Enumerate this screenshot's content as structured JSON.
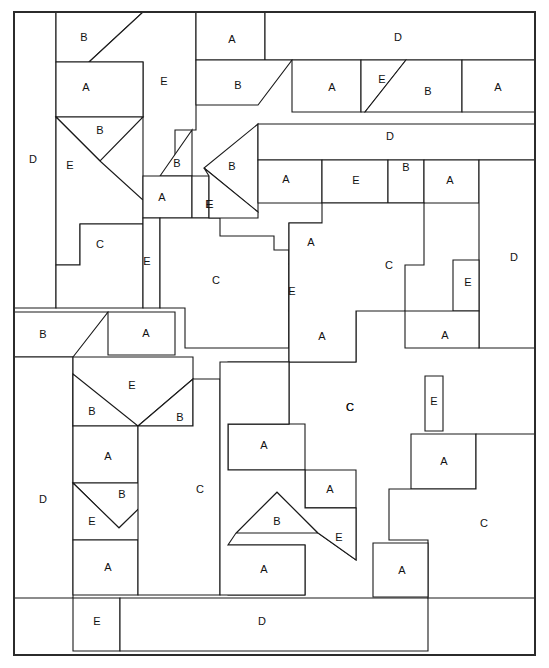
{
  "diagram": {
    "canvas": {
      "width": 549,
      "height": 668
    },
    "sheet": {
      "x": 14,
      "y": 12,
      "width": 521,
      "height": 643
    },
    "stroke_color": "#1a1a1a",
    "frame_color": "#2b2b2b",
    "fill_color": "#ffffff",
    "piece_types": [
      "A",
      "B",
      "C",
      "D",
      "E"
    ],
    "piece_count": 62,
    "pieces": [
      {
        "id": "p01",
        "label": "D",
        "lx": 33,
        "ly": 160,
        "points": "14,12 56,12 56,308 14,308"
      },
      {
        "id": "p02",
        "label": "B",
        "lx": 84,
        "ly": 38,
        "points": "56,12 143,12 89,62 56,62"
      },
      {
        "id": "p03",
        "label": "E",
        "lx": 164,
        "ly": 82,
        "points": "143,12 196,12 196,130 175,130 175,200 143,200 143,62 89,62"
      },
      {
        "id": "p04",
        "label": "A",
        "lx": 86,
        "ly": 88,
        "points": "56,62 143,62 143,117 56,117"
      },
      {
        "id": "p05",
        "label": "B",
        "lx": 100,
        "ly": 131,
        "points": "56,117 143,117 100,161"
      },
      {
        "id": "p06",
        "label": "E",
        "lx": 70,
        "ly": 166,
        "points": "56,117 100,161 143,200 143,224 80,224 80,265 56,265"
      },
      {
        "id": "p07",
        "label": "C",
        "lx": 100,
        "ly": 245,
        "points": "80,224 143,224 143,308 56,308 56,265 80,265"
      },
      {
        "id": "p08",
        "label": "B",
        "lx": 177,
        "ly": 164,
        "points": "160,176 192,130 192,176"
      },
      {
        "id": "p09",
        "label": "A",
        "lx": 162,
        "ly": 198,
        "points": "143,176 192,176 192,218 143,218"
      },
      {
        "id": "p10",
        "label": "E",
        "lx": 147,
        "ly": 262,
        "points": "143,218 160,218 160,308 143,308"
      },
      {
        "id": "p11",
        "label": "E",
        "lx": 210,
        "ly": 205,
        "points": "192,176 209,176 209,218 192,218"
      },
      {
        "id": "p12",
        "label": "C",
        "lx": 216,
        "ly": 281,
        "points": "160,218 220,218 220,236 274,236 274,250 289,250 289,348 185,348 185,308 160,308"
      },
      {
        "id": "p13",
        "label": "A",
        "lx": 232,
        "ly": 40,
        "points": "196,12 265,12 265,60 196,60"
      },
      {
        "id": "p14",
        "label": "D",
        "lx": 398,
        "ly": 38,
        "points": "265,12 535,12 535,60 265,60"
      },
      {
        "id": "p15",
        "label": "B",
        "lx": 238,
        "ly": 86,
        "points": "196,60 292,60 258,105 196,105"
      },
      {
        "id": "p16",
        "label": "A",
        "lx": 332,
        "ly": 88,
        "points": "292,60 361,60 361,112 292,112"
      },
      {
        "id": "p17",
        "label": "E",
        "lx": 382,
        "ly": 80,
        "points": "361,60 406,60 365,112 361,112"
      },
      {
        "id": "p18",
        "label": "B",
        "lx": 428,
        "ly": 92,
        "points": "406,60 462,60 462,112 365,112"
      },
      {
        "id": "p19",
        "label": "A",
        "lx": 498,
        "ly": 88,
        "points": "462,60 535,60 535,112 462,112"
      },
      {
        "id": "p20",
        "label": "B",
        "lx": 232,
        "ly": 167,
        "points": "258,124 258,212 204,168"
      },
      {
        "id": "p21",
        "label": "D",
        "lx": 390,
        "ly": 137,
        "points": "258,124 535,124 535,160 258,160"
      },
      {
        "id": "p22",
        "label": "E",
        "lx": 209,
        "ly": 205,
        "points": "204,168 258,212 258,218 209,218 209,176"
      },
      {
        "id": "p23",
        "label": "A",
        "lx": 286,
        "ly": 180,
        "points": "258,160 322,160 322,203 258,203"
      },
      {
        "id": "p24",
        "label": "E",
        "lx": 356,
        "ly": 181,
        "points": "322,160 388,160 388,203 322,203"
      },
      {
        "id": "p25",
        "label": "B",
        "lx": 406,
        "ly": 168,
        "points": "388,160 424,160 424,203 388,203"
      },
      {
        "id": "p26",
        "label": "A",
        "lx": 450,
        "ly": 181,
        "points": "424,160 479,160 479,203 424,203"
      },
      {
        "id": "p27",
        "label": "D",
        "lx": 514,
        "ly": 258,
        "points": "479,160 535,160 535,348 479,348"
      },
      {
        "id": "p28",
        "label": "A",
        "lx": 311,
        "ly": 243,
        "points": "289,223 334,223 334,264 289,264"
      },
      {
        "id": "p29",
        "label": "E",
        "lx": 292,
        "ly": 292,
        "points": "289,264 296,264 296,311 289,311"
      },
      {
        "id": "p30",
        "label": "A",
        "lx": 322,
        "ly": 337,
        "points": "289,311 356,311 356,362 289,362"
      },
      {
        "id": "p31",
        "label": "C",
        "lx": 389,
        "ly": 266,
        "points": "289,223 322,223 322,203 424,203 424,265 405,265 405,311 356,311 356,362 289,362"
      },
      {
        "id": "p32",
        "label": "E",
        "lx": 468,
        "ly": 283,
        "points": "453,260 479,260 479,311 453,311"
      },
      {
        "id": "p33",
        "label": "A",
        "lx": 445,
        "ly": 336,
        "points": "405,311 479,311 479,348 405,348"
      },
      {
        "id": "p34",
        "label": "B",
        "lx": 43,
        "ly": 335,
        "points": "14,312 108,312 73,357 14,357"
      },
      {
        "id": "p35",
        "label": "A",
        "lx": 146,
        "ly": 334,
        "points": "108,312 175,312 175,355 108,355"
      },
      {
        "id": "p36",
        "label": "D",
        "lx": 43,
        "ly": 500,
        "points": "14,357 73,357 73,598 14,598"
      },
      {
        "id": "p37",
        "label": "E",
        "lx": 132,
        "ly": 386,
        "points": "73,357 135,357 193,357 193,379 138,426 73,426"
      },
      {
        "id": "p38",
        "label": "B",
        "lx": 92,
        "ly": 412,
        "points": "73,374 138,426 73,426"
      },
      {
        "id": "p39",
        "label": "B",
        "lx": 180,
        "ly": 418,
        "points": "193,379 193,426 138,426"
      },
      {
        "id": "p40",
        "label": "A",
        "lx": 108,
        "ly": 457,
        "points": "73,426 138,426 138,483 73,483"
      },
      {
        "id": "p41",
        "label": "B",
        "lx": 122,
        "ly": 495,
        "points": "73,483 165,483 119,528"
      },
      {
        "id": "p42",
        "label": "E",
        "lx": 92,
        "ly": 522,
        "points": "73,483 119,528 165,483 165,540 73,540"
      },
      {
        "id": "p43",
        "label": "A",
        "lx": 108,
        "ly": 568,
        "points": "73,540 138,540 138,595 73,595"
      },
      {
        "id": "p44",
        "label": "C",
        "lx": 200,
        "ly": 490,
        "points": "138,426 193,426 193,379 220,379 220,595 138,595"
      },
      {
        "id": "p45",
        "label": "E",
        "lx": 97,
        "ly": 622,
        "points": "73,598 120,598 120,651 73,651"
      },
      {
        "id": "p46",
        "label": "D",
        "lx": 262,
        "ly": 622,
        "points": "120,598 428,598 428,651 120,651"
      },
      {
        "id": "p47",
        "label": "A",
        "lx": 264,
        "ly": 446,
        "points": "228,424 305,424 305,470 228,470"
      },
      {
        "id": "p48",
        "label": "A",
        "lx": 330,
        "ly": 490,
        "points": "305,470 356,470 356,508 305,508"
      },
      {
        "id": "p49",
        "label": "B",
        "lx": 277,
        "ly": 522,
        "points": "236,533 277,492 318,533"
      },
      {
        "id": "p50",
        "label": "E",
        "lx": 339,
        "ly": 538,
        "points": "305,508 356,508 356,560 318,533"
      },
      {
        "id": "p51",
        "label": "A",
        "lx": 264,
        "ly": 570,
        "points": "228,545 305,545 305,595 228,595"
      },
      {
        "id": "p52",
        "label": "C",
        "lx": 350,
        "ly": 408,
        "points": "228,362 289,362 289,424 228,424"
      },
      {
        "id": "p53",
        "label": "E",
        "lx": 434,
        "ly": 402,
        "points": "425,376 443,376 443,431 425,431"
      },
      {
        "id": "p54",
        "label": "A",
        "lx": 444,
        "ly": 462,
        "points": "411,434 476,434 476,489 411,489"
      },
      {
        "id": "p55",
        "label": "C",
        "lx": 484,
        "ly": 524,
        "points": "389,489 476,489 476,434 535,434 535,598 428,598 428,540 389,540"
      },
      {
        "id": "p56",
        "label": "A",
        "lx": 402,
        "ly": 571,
        "points": "373,543 428,543 428,597 373,597"
      },
      {
        "id": "p57",
        "label": "C",
        "lx": 350,
        "ly": 408,
        "points": "220,362 289,362 289,424 228,424 228,470 305,470 305,508 356,508 356,560 318,533 277,492 236,533 228,545 305,545 305,595 220,595"
      }
    ]
  }
}
